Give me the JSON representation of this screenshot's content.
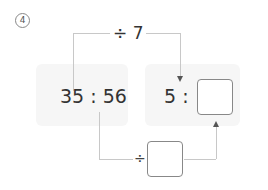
{
  "problem": {
    "number_label": "4",
    "left_ratio": "35 : 56",
    "right_ratio_first": "5 :",
    "top_operation": "÷ 7",
    "bottom_operation_symbol": "÷",
    "right_answer_value": "",
    "bottom_answer_value": ""
  },
  "colors": {
    "panel_bg": "#f6f6f6",
    "line": "#c8c8c8",
    "box_border": "#888888",
    "text": "#333333"
  }
}
